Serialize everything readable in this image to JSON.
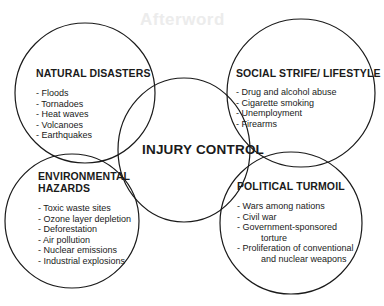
{
  "diagram": {
    "ghost_text": "Afterword",
    "center": {
      "label": "INJURY CONTROL"
    },
    "colors": {
      "stroke": "#1a1a1a",
      "text": "#1a1a1a",
      "background": "#ffffff"
    },
    "circles": [
      {
        "id": "natural-disasters",
        "title": "NATURAL DISASTERS",
        "items": [
          "- Floods",
          "- Tornadoes",
          "- Heat waves",
          "- Volcanoes",
          "- Earthquakes"
        ]
      },
      {
        "id": "social-strife",
        "title": "SOCIAL STRIFE/ LIFESTYLE",
        "items": [
          "- Drug and alcohol abuse",
          "- Cigarette smoking",
          "- Unemployment",
          "- Firearms"
        ]
      },
      {
        "id": "environmental-hazards",
        "title_line1": "ENVIRONMENTAL",
        "title_line2": "HAZARDS",
        "items": [
          "- Toxic waste sites",
          "- Ozone layer depletion",
          "- Deforestation",
          "- Air pollution",
          "- Nuclear emissions",
          "- Industrial explosions"
        ]
      },
      {
        "id": "political-turmoil",
        "title": "POLITICAL TURMOIL",
        "items": [
          "- Wars among nations",
          "- Civil war",
          "- Government-sponsored",
          "torture",
          "- Proliferation of conventional",
          "and nuclear weapons"
        ]
      }
    ]
  }
}
